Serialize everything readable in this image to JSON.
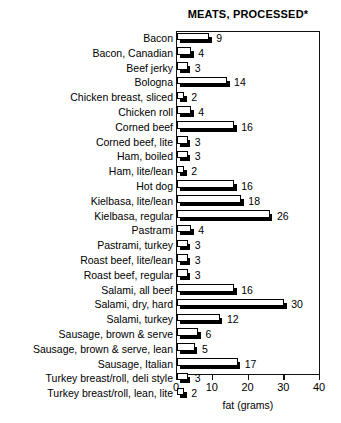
{
  "chart_data": {
    "type": "bar",
    "orientation": "horizontal",
    "title": "MEATS, PROCESSED*",
    "xlabel": "fat (grams)",
    "ylabel": "",
    "xlim": [
      0,
      40
    ],
    "xticks": [
      0,
      10,
      20,
      30,
      40
    ],
    "xtick_labels": [
      "0",
      "10",
      "20",
      "30",
      "40"
    ],
    "grid": false,
    "legend": null,
    "categories": [
      "Bacon",
      "Bacon, Canadian",
      "Beef jerky",
      "Bologna",
      "Chicken breast, sliced",
      "Chicken roll",
      "Corned beef",
      "Corned beef, lite",
      "Ham, boiled",
      "Ham, lite/lean",
      "Hot dog",
      "Kielbasa, lite/lean",
      "Kielbasa, regular",
      "Pastrami",
      "Pastrami, turkey",
      "Roast beef, lite/lean",
      "Roast beef, regular",
      "Salami, all beef",
      "Salami, dry, hard",
      "Salami, turkey",
      "Sausage, brown & serve",
      "Sausage, brown & serve, lean",
      "Sausage, Italian",
      "Turkey breast/roll, deli style",
      "Turkey breast/roll, lean, lite"
    ],
    "values": [
      9,
      4,
      3,
      14,
      2,
      4,
      16,
      3,
      3,
      2,
      16,
      18,
      26,
      4,
      3,
      3,
      3,
      16,
      30,
      12,
      6,
      5,
      17,
      3,
      2
    ],
    "value_labels": [
      "9",
      "4",
      "3",
      "14",
      "2",
      "4",
      "16",
      "3",
      "3",
      "2",
      "16",
      "18",
      "26",
      "4",
      "3",
      "3",
      "3",
      "16",
      "30",
      "12",
      "6",
      "5",
      "17",
      "3",
      "2"
    ],
    "colors": {
      "bar_face": "#ffffff",
      "bar_outline": "#000000",
      "bar_shadow": "#000000",
      "axis": "#111111",
      "text": "#000000",
      "background": "#ffffff"
    }
  }
}
